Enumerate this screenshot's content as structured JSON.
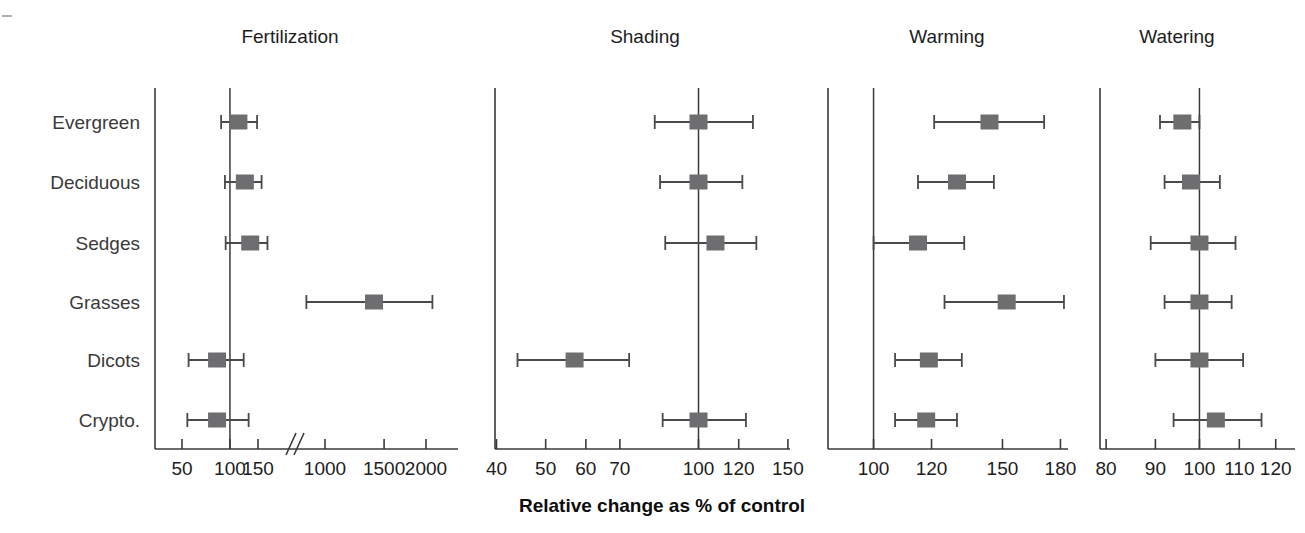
{
  "figure": {
    "xlabel": "Relative change as % of control",
    "categories": [
      "Evergreen",
      "Deciduous",
      "Sedges",
      "Grasses",
      "Dicots",
      "Crypto."
    ],
    "marker_color": "#6e6e70",
    "axis_color": "#3a3a3a",
    "reference_value": 100
  },
  "chart_data": {
    "type": "scatter",
    "title": "",
    "xlabel": "Relative change as % of control",
    "ylabel": "",
    "grid": false,
    "legend": "none",
    "categories": [
      "Evergreen",
      "Deciduous",
      "Sedges",
      "Grasses",
      "Dicots",
      "Crypto."
    ],
    "panels": [
      {
        "name": "Fertilization",
        "scale": "log-broken",
        "axis_break": true,
        "ticks": [
          50,
          100,
          150,
          1000,
          1500,
          2000
        ],
        "tick_labels": [
          "50",
          "100",
          "150",
          "1000",
          "1500",
          "2000"
        ],
        "xlim": [
          50,
          2000
        ],
        "points": [
          {
            "category": "Evergreen",
            "value": 113,
            "ci_low": 88,
            "ci_high": 148
          },
          {
            "category": "Deciduous",
            "value": 124,
            "ci_low": 93,
            "ci_high": 158
          },
          {
            "category": "Sedges",
            "value": 134,
            "ci_low": 94,
            "ci_high": 172
          },
          {
            "category": "Grasses",
            "value": 1400,
            "ci_low": 880,
            "ci_high": 2090
          },
          {
            "category": "Dicots",
            "value": 83,
            "ci_low": 55,
            "ci_high": 122
          },
          {
            "category": "Crypto.",
            "value": 83,
            "ci_low": 54,
            "ci_high": 131
          }
        ]
      },
      {
        "name": "Shading",
        "scale": "log",
        "axis_break": false,
        "ticks": [
          40,
          50,
          60,
          70,
          100,
          120,
          150
        ],
        "tick_labels": [
          "40",
          "50",
          "60",
          "70",
          "100",
          "120",
          "150"
        ],
        "xlim": [
          40,
          150
        ],
        "points": [
          {
            "category": "Evergreen",
            "value": 100,
            "ci_low": 82,
            "ci_high": 128
          },
          {
            "category": "Deciduous",
            "value": 100,
            "ci_low": 84,
            "ci_high": 122
          },
          {
            "category": "Sedges",
            "value": 108,
            "ci_low": 86,
            "ci_high": 130
          },
          {
            "category": "Grasses",
            "value": null,
            "ci_low": null,
            "ci_high": null
          },
          {
            "category": "Dicots",
            "value": 57,
            "ci_low": 44,
            "ci_high": 73
          },
          {
            "category": "Crypto.",
            "value": 100,
            "ci_low": 85,
            "ci_high": 124
          }
        ]
      },
      {
        "name": "Warming",
        "scale": "log",
        "axis_break": false,
        "ticks": [
          100,
          120,
          150,
          180
        ],
        "tick_labels": [
          "100",
          "120",
          "150",
          "180"
        ],
        "xlim": [
          92,
          190
        ],
        "points": [
          {
            "category": "Evergreen",
            "value": 144,
            "ci_low": 121,
            "ci_high": 171
          },
          {
            "category": "Deciduous",
            "value": 130,
            "ci_low": 115,
            "ci_high": 146
          },
          {
            "category": "Sedges",
            "value": 115,
            "ci_low": 100,
            "ci_high": 133
          },
          {
            "category": "Grasses",
            "value": 152,
            "ci_low": 125,
            "ci_high": 182
          },
          {
            "category": "Dicots",
            "value": 119,
            "ci_low": 107,
            "ci_high": 132
          },
          {
            "category": "Crypto.",
            "value": 118,
            "ci_low": 107,
            "ci_high": 130
          }
        ]
      },
      {
        "name": "Watering",
        "scale": "log",
        "axis_break": false,
        "ticks": [
          80,
          90,
          100,
          110,
          120
        ],
        "tick_labels": [
          "80",
          "90",
          "100",
          "110",
          "120"
        ],
        "xlim": [
          78,
          124
        ],
        "points": [
          {
            "category": "Evergreen",
            "value": 96,
            "ci_low": 91,
            "ci_high": 100
          },
          {
            "category": "Deciduous",
            "value": 98,
            "ci_low": 92,
            "ci_high": 105
          },
          {
            "category": "Sedges",
            "value": 100,
            "ci_low": 89,
            "ci_high": 109
          },
          {
            "category": "Grasses",
            "value": 100,
            "ci_low": 92,
            "ci_high": 108
          },
          {
            "category": "Dicots",
            "value": 100,
            "ci_low": 90,
            "ci_high": 111
          },
          {
            "category": "Crypto.",
            "value": 104,
            "ci_low": 94,
            "ci_high": 116
          }
        ]
      }
    ]
  }
}
